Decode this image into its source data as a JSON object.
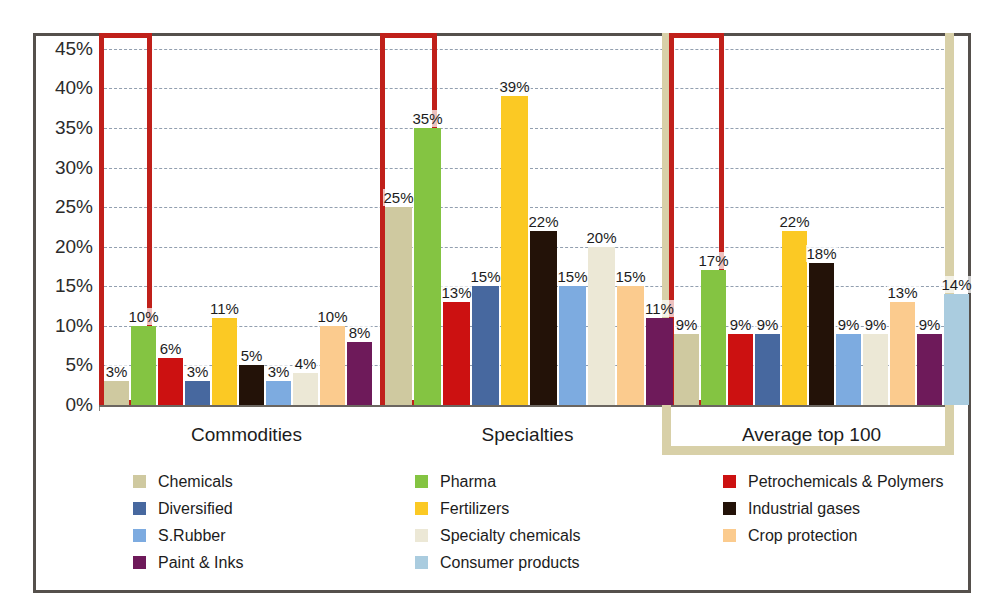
{
  "chart_data": {
    "type": "bar",
    "title": "",
    "subtitle": "",
    "xlabel": "",
    "ylabel": "",
    "ylim": [
      0,
      47
    ],
    "grid": true,
    "legend_position": "bottom",
    "ytick_labels": [
      "45%",
      "40%",
      "35%",
      "30%",
      "25%",
      "20%",
      "15%",
      "10%",
      "5%",
      "0%"
    ],
    "ytick_values": [
      45,
      40,
      35,
      30,
      25,
      20,
      15,
      10,
      5,
      0
    ],
    "categories": [
      "Commodities",
      "Specialties",
      "Average top 100"
    ],
    "series": [
      {
        "name": "Chemicals",
        "color": "#cfc9a0",
        "values": [
          3,
          25,
          9
        ],
        "labels": [
          "3%",
          "25%",
          "9%"
        ]
      },
      {
        "name": "Pharma",
        "color": "#84c442",
        "values": [
          10,
          35,
          17
        ],
        "labels": [
          "10%",
          "35%",
          "17%"
        ]
      },
      {
        "name": "Petrochemicals & Polymers",
        "color": "#cc1111",
        "values": [
          6,
          13,
          9
        ],
        "labels": [
          "6%",
          "13%",
          "9%"
        ]
      },
      {
        "name": "Diversified",
        "color": "#47689f",
        "values": [
          3,
          15,
          9
        ],
        "labels": [
          "3%",
          "15%",
          "9%"
        ]
      },
      {
        "name": "Fertilizers",
        "color": "#fbc924",
        "values": [
          11,
          39,
          22
        ],
        "labels": [
          "11%",
          "39%",
          "22%"
        ]
      },
      {
        "name": "Industrial gases",
        "color": "#231208",
        "values": [
          5,
          22,
          18
        ],
        "labels": [
          "5%",
          "22%",
          "18%"
        ]
      },
      {
        "name": "S.Rubber",
        "color": "#7dabe0",
        "values": [
          3,
          15,
          9
        ],
        "labels": [
          "3%",
          "15%",
          "9%"
        ]
      },
      {
        "name": "Specialty chemicals",
        "color": "#ece8d6",
        "values": [
          4,
          20,
          9
        ],
        "labels": [
          "4%",
          "20%",
          "9%"
        ]
      },
      {
        "name": "Crop protection",
        "color": "#fbcb8e",
        "values": [
          10,
          15,
          13
        ],
        "labels": [
          "10%",
          "15%",
          "13%"
        ]
      },
      {
        "name": "Paint & Inks",
        "color": "#6e1a5a",
        "values": [
          8,
          11,
          9
        ],
        "labels": [
          "8%",
          "11%",
          "9%"
        ]
      },
      {
        "name": "Consumer products",
        "color": "#aaccdf",
        "values": [
          null,
          null,
          14
        ],
        "labels": [
          "",
          "",
          "14%"
        ]
      }
    ],
    "annotations": [
      {
        "name": "red-highlight-commodities",
        "kind": "red-box",
        "covers": [
          "Chemicals",
          "Pharma"
        ],
        "group": "Commodities"
      },
      {
        "name": "red-highlight-specialties",
        "kind": "red-box",
        "covers": [
          "Chemicals",
          "Pharma"
        ],
        "group": "Specialties"
      },
      {
        "name": "red-highlight-average",
        "kind": "red-box",
        "covers": [
          "Chemicals",
          "Pharma"
        ],
        "group": "Average top 100"
      },
      {
        "name": "khaki-highlight-average",
        "kind": "khaki-box",
        "covers": [
          "Average top 100"
        ],
        "group": "Average top 100"
      }
    ]
  },
  "legend": {
    "columns": [
      {
        "items": [
          "Chemicals",
          "Diversified",
          "S.Rubber",
          "Paint & Inks"
        ]
      },
      {
        "items": [
          "Pharma",
          "Fertilizers",
          "Specialty chemicals",
          "Consumer products"
        ]
      },
      {
        "items": [
          "Petrochemicals & Polymers",
          "Industrial gases",
          "Crop protection"
        ]
      }
    ]
  },
  "colors": {
    "frame": "#55504c",
    "gridline": "#7f8fa2",
    "red_highlight": "#c0201a",
    "khaki_highlight": "#d8d0a8",
    "background": "#ffffff"
  }
}
